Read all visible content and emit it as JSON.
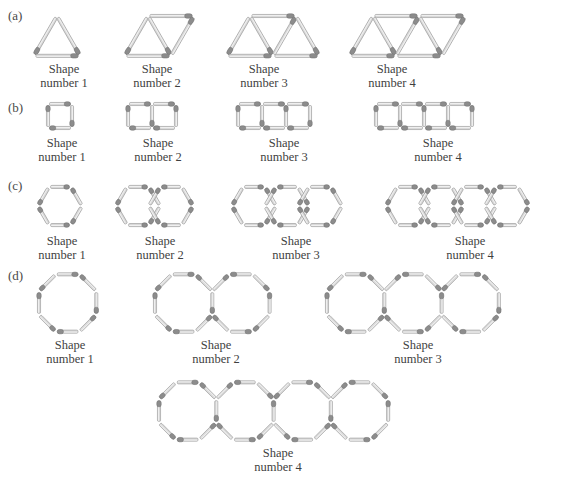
{
  "figure": {
    "header_partial_text": "from matchsticks:",
    "background": "#ffffff",
    "matchstick": {
      "body_color": "#d9d9d9",
      "body_edge_color": "#9a9a9a",
      "head_color": "#8c8c8c",
      "head_edge_color": "#6f6f6f"
    },
    "caption_line1": "Shape",
    "rows": [
      {
        "key": "a",
        "label": "(a)",
        "shape_kind": "triangle",
        "description": "Row of joined equilateral triangles made of matchsticks",
        "shapes": [
          {
            "caption_line2": "number 1",
            "triangle_count": 1,
            "matchstick_count": 3
          },
          {
            "caption_line2": "number 2",
            "triangle_count": 2,
            "matchstick_count": 5
          },
          {
            "caption_line2": "number 3",
            "triangle_count": 3,
            "matchstick_count": 7
          },
          {
            "caption_line2": "number 4",
            "triangle_count": 4,
            "matchstick_count": 9
          }
        ]
      },
      {
        "key": "b",
        "label": "(b)",
        "shape_kind": "square",
        "description": "Row of joined squares made of matchsticks",
        "shapes": [
          {
            "caption_line2": "number 1",
            "square_count": 1,
            "matchstick_count": 4
          },
          {
            "caption_line2": "number 2",
            "square_count": 2,
            "matchstick_count": 7
          },
          {
            "caption_line2": "number 3",
            "square_count": 3,
            "matchstick_count": 10
          },
          {
            "caption_line2": "number 4",
            "square_count": 4,
            "matchstick_count": 13
          }
        ]
      },
      {
        "key": "c",
        "label": "(c)",
        "shape_kind": "hexagon",
        "description": "Row of joined regular hexagons made of matchsticks",
        "shapes": [
          {
            "caption_line2": "number 1",
            "hexagon_count": 1,
            "matchstick_count": 6
          },
          {
            "caption_line2": "number 2",
            "hexagon_count": 2,
            "matchstick_count": 11
          },
          {
            "caption_line2": "number 3",
            "hexagon_count": 3,
            "matchstick_count": 16
          },
          {
            "caption_line2": "number 4",
            "hexagon_count": 4,
            "matchstick_count": 21
          }
        ]
      },
      {
        "key": "d",
        "label": "(d)",
        "shape_kind": "octagon",
        "description": "Row of joined regular octagons made of matchsticks",
        "shapes": [
          {
            "caption_line2": "number 1",
            "octagon_count": 1,
            "matchstick_count": 8
          },
          {
            "caption_line2": "number 2",
            "octagon_count": 2,
            "matchstick_count": 15
          },
          {
            "caption_line2": "number 3",
            "octagon_count": 3,
            "matchstick_count": 22
          },
          {
            "caption_line2": "number 4",
            "octagon_count": 4,
            "matchstick_count": 29
          }
        ]
      }
    ]
  }
}
